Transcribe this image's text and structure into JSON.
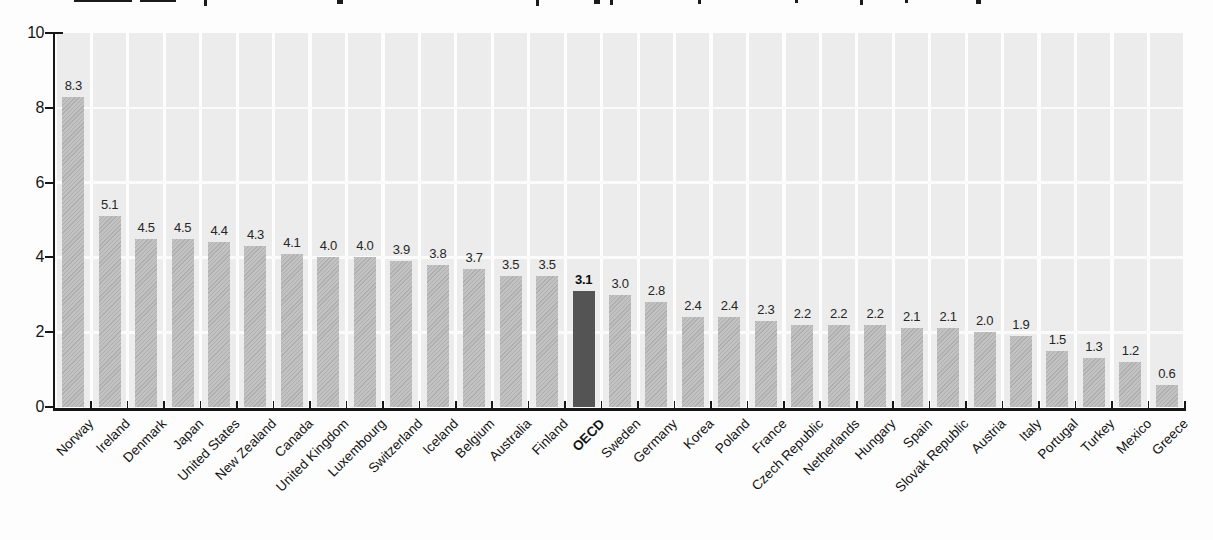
{
  "page": {
    "background": "#fdfdfd"
  },
  "cropped_title": {
    "visible": "only bottom fragments of title glyphs at top edge of screenshot",
    "marks": [
      {
        "x": 74,
        "w": 58,
        "h": 2
      },
      {
        "x": 140,
        "w": 36,
        "h": 2
      },
      {
        "x": 204,
        "w": 3,
        "h": 6
      },
      {
        "x": 337,
        "w": 6,
        "h": 4
      },
      {
        "x": 536,
        "w": 3,
        "h": 6
      },
      {
        "x": 594,
        "w": 6,
        "h": 4
      },
      {
        "x": 610,
        "w": 3,
        "h": 5
      },
      {
        "x": 698,
        "w": 3,
        "h": 4
      },
      {
        "x": 795,
        "w": 3,
        "h": 3
      },
      {
        "x": 860,
        "w": 3,
        "h": 5
      },
      {
        "x": 905,
        "w": 3,
        "h": 3
      },
      {
        "x": 976,
        "w": 5,
        "h": 4
      }
    ]
  },
  "chart_data": {
    "type": "bar",
    "categories": [
      "Norway",
      "Ireland",
      "Denmark",
      "Japan",
      "United States",
      "New Zealand",
      "Canada",
      "United Kingdom",
      "Luxembourg",
      "Switzerland",
      "Iceland",
      "Belgium",
      "Australia",
      "Finland",
      "OECD",
      "Sweden",
      "Germany",
      "Korea",
      "Poland",
      "France",
      "Czech Republic",
      "Netherlands",
      "Hungary",
      "Spain",
      "Slovak Republic",
      "Austria",
      "Italy",
      "Portugal",
      "Turkey",
      "Mexico",
      "Greece"
    ],
    "values": [
      8.3,
      5.1,
      4.5,
      4.5,
      4.4,
      4.3,
      4.1,
      4.0,
      4.0,
      3.9,
      3.8,
      3.7,
      3.5,
      3.5,
      3.1,
      3.0,
      2.8,
      2.4,
      2.4,
      2.3,
      2.2,
      2.2,
      2.2,
      2.1,
      2.1,
      2.0,
      1.9,
      1.5,
      1.3,
      1.2,
      0.6
    ],
    "value_labels": [
      "8.3",
      "5.1",
      "4.5",
      "4.5",
      "4.4",
      "4.3",
      "4.1",
      "4.0",
      "4.0",
      "3.9",
      "3.8",
      "3.7",
      "3.5",
      "3.5",
      "3.1",
      "3.0",
      "2.8",
      "2.4",
      "2.4",
      "2.3",
      "2.2",
      "2.2",
      "2.2",
      "2.1",
      "2.1",
      "2.0",
      "1.9",
      "1.5",
      "1.3",
      "1.2",
      "0.6"
    ],
    "highlight_category": "OECD",
    "highlight_index": 14,
    "title": "",
    "xlabel": "",
    "ylabel": "",
    "ylim": [
      0,
      10
    ],
    "y_ticks": [
      0,
      2,
      4,
      6,
      8,
      10
    ],
    "y_tick_labels": [
      "0",
      "2",
      "4",
      "6",
      "8",
      "10"
    ],
    "legend": "none",
    "grid": "white horizontal gridlines at each y tick over light-gray vertical column bands",
    "colors": {
      "bar": "#c2c2c2",
      "bar_hatch": "#969696",
      "highlight_bar": "#545454",
      "column_band": "#ececec",
      "gridline": "#fbfbfb",
      "axis": "#161616",
      "value_label": "#262626",
      "tick_label": "#161616"
    }
  }
}
